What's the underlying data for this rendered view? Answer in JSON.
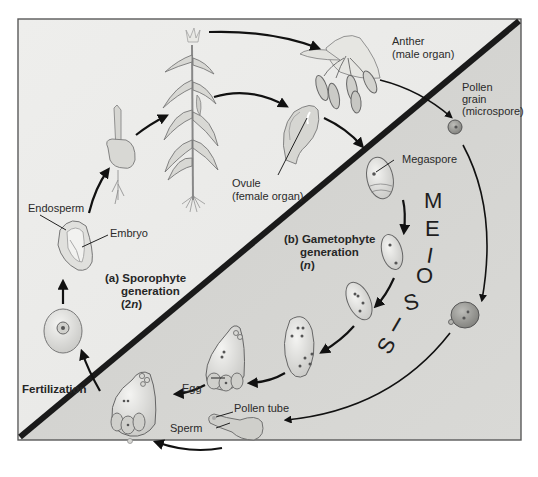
{
  "figure": {
    "type": "life-cycle diagram",
    "colors": {
      "sporophyte_bg": "#ececea",
      "gametophyte_bg": "#d2d2cf",
      "divider": "#1a1a1a",
      "frame": "#555555",
      "arrows": "#111111"
    }
  },
  "regions": {
    "sporophyte": {
      "label": "(a) Sporophyte",
      "label2": "generation",
      "ploidy": "(2n)",
      "ploidy_num": "(2",
      "ploidy_n": "n",
      "ploidy_close": ")"
    },
    "gametophyte": {
      "label": "(b) Gametophyte",
      "label2": "generation",
      "ploidy_open": "(",
      "ploidy_n": "n",
      "ploidy_close": ")"
    }
  },
  "labels": {
    "endosperm": "Endosperm",
    "embryo": "Embryo",
    "anther_1": "Anther",
    "anther_2": "(male organ)",
    "pollen_1": "Pollen",
    "pollen_2": "grain",
    "pollen_3": "(microspore)",
    "ovule_1": "Ovule",
    "ovule_2": "(female organ)",
    "megaspore": "Megaspore",
    "egg": "Egg",
    "pollen_tube": "Pollen tube",
    "sperm": "Sperm",
    "fertilization": "Fertilization"
  },
  "meiosis_letters": [
    "M",
    "E",
    "I",
    "O",
    "S",
    "I",
    "S"
  ],
  "stages": [
    "Zygote",
    "Seed (endosperm + embryo)",
    "Seedling",
    "Mature corn plant",
    "Anther (male organ)",
    "Ovule (female organ)",
    "Pollen grain (microspore)",
    "Megaspore",
    "Embryo sac development (2 nuclei)",
    "Embryo sac development (4 nuclei)",
    "Embryo sac development (8 nuclei)",
    "Mature embryo sac with egg",
    "Germinated pollen grain",
    "Pollen tube with sperm",
    "Fertilization"
  ]
}
